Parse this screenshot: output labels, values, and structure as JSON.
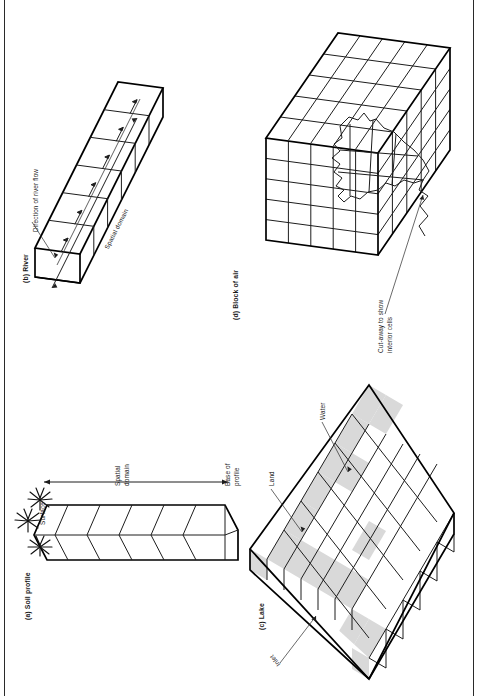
{
  "figure": {
    "orientation": "rotated-90-ccw",
    "page_frame": {
      "left_rule": true,
      "right_rule": true
    },
    "panels": [
      {
        "id": "a",
        "caption": "(a) Soil profile",
        "subject": "soil-profile",
        "cells": 6,
        "annotations": [
          {
            "name": "surface",
            "text": "Surface"
          },
          {
            "name": "spatial-domain",
            "text": "Spatial\ndomain",
            "line1": "Spatial",
            "line2": "domain"
          },
          {
            "name": "base-of-profile",
            "text": "Base of\nprofile",
            "line1": "Base of",
            "line2": "profile"
          }
        ]
      },
      {
        "id": "b",
        "caption": "(b) River",
        "subject": "river-prism",
        "cells": 6,
        "annotations": [
          {
            "name": "direction-of-river-flow",
            "text": "Direction of river flow"
          },
          {
            "name": "spatial-domain",
            "text": "Spatial domain"
          }
        ]
      },
      {
        "id": "c",
        "caption": "(c) Lake",
        "subject": "lake-grid",
        "grid": {
          "rows": 6,
          "cols": 6
        },
        "annotations": [
          {
            "name": "land",
            "text": "Land"
          },
          {
            "name": "water",
            "text": "Water"
          },
          {
            "name": "inlet",
            "text": "Inlet"
          }
        ],
        "legend": {
          "shaded": "Land",
          "unshaded": "Water"
        }
      },
      {
        "id": "d",
        "caption": "(d) Block of air",
        "subject": "air-block-cube",
        "grid": {
          "rows": 5,
          "cols": 5
        },
        "annotations": [
          {
            "name": "cut-away",
            "text": "Cut-away to show\ninterior cells",
            "line1": "Cut-away to show",
            "line2": "interior cells"
          }
        ]
      }
    ],
    "colors": {
      "ink": "#1d1d1d",
      "heavy_ink": "#000000",
      "shade_fill": "#d9d9d9",
      "paper": "#ffffff"
    }
  }
}
